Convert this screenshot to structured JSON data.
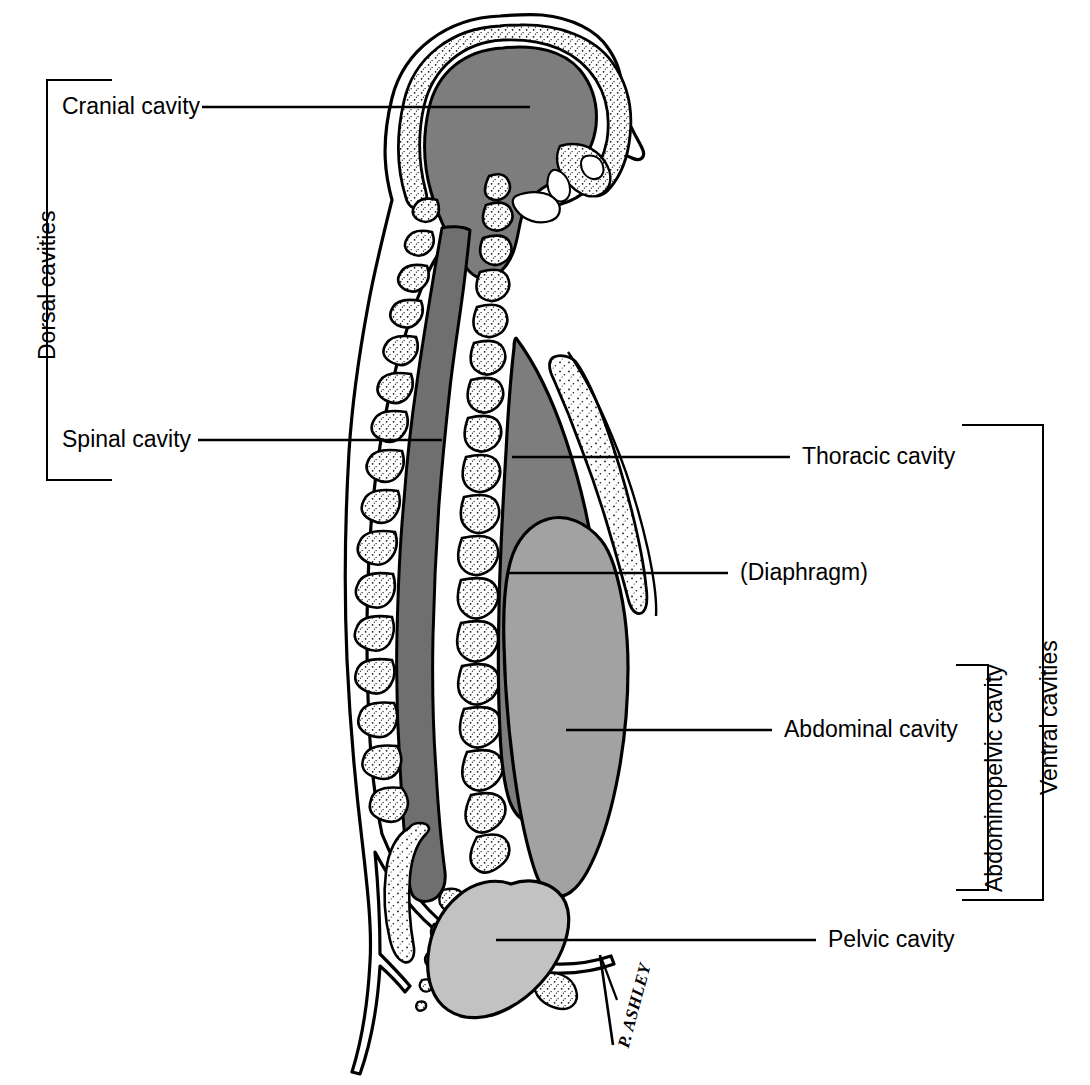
{
  "figure": {
    "signature": "P. ASHLEY",
    "colors": {
      "cranial_fill": "#7d7d7d",
      "spinal_fill": "#6f6f6f",
      "thoracic_fill": "#7d7d7d",
      "abdominal_fill": "#a2a2a2",
      "pelvic_fill": "#c2c2c2",
      "bone_fill": "#ffffff",
      "outline": "#000000",
      "background": "#ffffff"
    }
  },
  "labels": {
    "cranial_cavity": "Cranial cavity",
    "spinal_cavity": "Spinal cavity",
    "thoracic_cavity": "Thoracic cavity",
    "diaphragm": "(Diaphragm)",
    "abdominal_cavity": "Abdominal cavity",
    "pelvic_cavity": "Pelvic cavity"
  },
  "groups": {
    "dorsal_cavities": "Dorsal cavities",
    "ventral_cavities": "Ventral cavities",
    "abdominopelvic_cavity": "Abdominopelvic cavity"
  }
}
